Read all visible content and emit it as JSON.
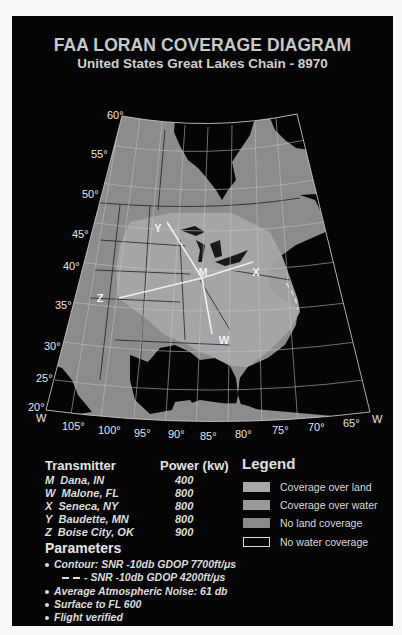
{
  "header": {
    "title": "FAA LORAN COVERAGE DIAGRAM",
    "subtitle": "United States Great Lakes Chain - 8970"
  },
  "map": {
    "latitude_labels": [
      "60°",
      "55°",
      "50°",
      "45°",
      "40°",
      "35°",
      "30°",
      "25°",
      "20°"
    ],
    "longitude_labels": [
      "105°",
      "100°",
      "95°",
      "90°",
      "85°",
      "80°",
      "75°",
      "70°",
      "65°"
    ],
    "west_label": "W",
    "transmitter_markers": [
      "M",
      "W",
      "X",
      "Y",
      "Z"
    ],
    "colors": {
      "background": "#050505",
      "land": "#8c8c8c",
      "coverage": "#a6a6a6",
      "water": "#050505",
      "lines": "#1c1c1c",
      "grid": "#bfbfbf",
      "baseline": "#e8e8e8"
    }
  },
  "transmitters": {
    "header_name": "Transmitter",
    "header_power": "Power (kw)",
    "rows": [
      {
        "code": "M",
        "name": "Dana, IN",
        "power": "400"
      },
      {
        "code": "W",
        "name": "Malone, FL",
        "power": "800"
      },
      {
        "code": "X",
        "name": "Seneca, NY",
        "power": "800"
      },
      {
        "code": "Y",
        "name": "Baudette, MN",
        "power": "800"
      },
      {
        "code": "Z",
        "name": "Boise City, OK",
        "power": "900"
      }
    ]
  },
  "legend": {
    "title": "Legend",
    "items": [
      {
        "label": "Coverage over land",
        "color": "#a8a8a8",
        "outlined": false
      },
      {
        "label": "Coverage over water",
        "color": "#9a9a9a",
        "outlined": false
      },
      {
        "label": "No land coverage",
        "color": "#8a8a8a",
        "outlined": false
      },
      {
        "label": "No water coverage",
        "color": "#050505",
        "outlined": true
      }
    ]
  },
  "parameters": {
    "title": "Parameters",
    "items": [
      "Contour: SNR -10db GDOP 7700ft/μs",
      "- SNR -10db GDOP 4200ft/μs",
      "Average Atmospheric Noise: 61 db",
      "Surface to FL 600",
      "Flight verified"
    ]
  }
}
